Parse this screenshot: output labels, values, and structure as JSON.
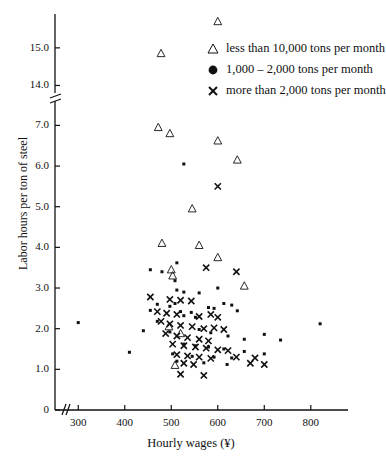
{
  "chart_data": {
    "type": "scatter",
    "title": "",
    "xlabel": "Hourly wages (¥)",
    "ylabel": "Labor hours per ton of steel",
    "xlim": [
      250,
      880
    ],
    "ylim_lower": [
      0,
      7.6
    ],
    "ylim_upper": [
      13.8,
      15.9
    ],
    "axis_break": {
      "y_below": 7.6,
      "y_above": 13.8,
      "x_break_near": 265
    },
    "grid": false,
    "legend_position": "upper-right-inside",
    "xticks": [
      300,
      400,
      500,
      600,
      700,
      800
    ],
    "yticks": [
      0,
      1.0,
      2.0,
      3.0,
      4.0,
      5.0,
      6.0,
      7.0,
      14.0,
      15.0
    ],
    "ytick_labels": [
      "0",
      "1.0",
      "2.0",
      "3.0",
      "4.0",
      "5.0",
      "6.0",
      "7.0",
      "14.0",
      "15.0"
    ],
    "xtick_labels": [
      "300",
      "400",
      "500",
      "600",
      "700",
      "800"
    ],
    "series": [
      {
        "name": "less than 10,000 tons per month",
        "marker": "triangle",
        "color": "#111111",
        "points": [
          [
            600,
            15.7
          ],
          [
            478,
            14.85
          ],
          [
            592,
            13.6
          ],
          [
            472,
            6.95
          ],
          [
            497,
            6.8
          ],
          [
            600,
            6.62
          ],
          [
            642,
            6.15
          ],
          [
            545,
            4.95
          ],
          [
            480,
            4.1
          ],
          [
            560,
            4.05
          ],
          [
            600,
            3.75
          ],
          [
            500,
            3.45
          ],
          [
            503,
            3.3
          ],
          [
            495,
            2.05
          ],
          [
            520,
            1.88
          ],
          [
            657,
            3.05
          ],
          [
            508,
            1.1
          ]
        ]
      },
      {
        "name": "1,000 – 2,000 tons per month",
        "marker": "dot",
        "color": "#111111",
        "points": [
          [
            527,
            6.05
          ],
          [
            455,
            3.45
          ],
          [
            480,
            3.4
          ],
          [
            512,
            3.62
          ],
          [
            508,
            3.18
          ],
          [
            512,
            2.95
          ],
          [
            527,
            2.9
          ],
          [
            508,
            2.62
          ],
          [
            560,
            2.88
          ],
          [
            600,
            3.0
          ],
          [
            300,
            2.15
          ],
          [
            470,
            2.6
          ],
          [
            455,
            2.45
          ],
          [
            497,
            2.55
          ],
          [
            520,
            2.42
          ],
          [
            543,
            2.4
          ],
          [
            580,
            2.52
          ],
          [
            592,
            2.5
          ],
          [
            613,
            2.62
          ],
          [
            630,
            2.58
          ],
          [
            642,
            2.44
          ],
          [
            527,
            2.32
          ],
          [
            552,
            2.28
          ],
          [
            470,
            2.18
          ],
          [
            820,
            2.12
          ],
          [
            440,
            1.95
          ],
          [
            497,
            1.92
          ],
          [
            560,
            1.98
          ],
          [
            585,
            1.9
          ],
          [
            700,
            1.86
          ],
          [
            622,
            1.82
          ],
          [
            657,
            1.74
          ],
          [
            735,
            1.72
          ],
          [
            527,
            1.62
          ],
          [
            552,
            1.58
          ],
          [
            580,
            1.55
          ],
          [
            613,
            1.5
          ],
          [
            410,
            1.42
          ],
          [
            503,
            1.38
          ],
          [
            545,
            1.32
          ],
          [
            592,
            1.3
          ],
          [
            630,
            1.28
          ],
          [
            657,
            1.44
          ],
          [
            700,
            1.38
          ],
          [
            512,
            1.2
          ],
          [
            570,
            1.16
          ],
          [
            620,
            1.12
          ]
        ]
      },
      {
        "name": "more than 2,000 tons per month",
        "marker": "cross",
        "color": "#111111",
        "points": [
          [
            600,
            5.5
          ],
          [
            575,
            3.5
          ],
          [
            640,
            3.4
          ],
          [
            455,
            2.78
          ],
          [
            497,
            2.72
          ],
          [
            520,
            2.7
          ],
          [
            543,
            2.68
          ],
          [
            470,
            2.42
          ],
          [
            490,
            2.38
          ],
          [
            512,
            2.35
          ],
          [
            560,
            2.3
          ],
          [
            585,
            2.35
          ],
          [
            600,
            2.28
          ],
          [
            478,
            2.18
          ],
          [
            497,
            2.12
          ],
          [
            520,
            2.08
          ],
          [
            545,
            2.05
          ],
          [
            570,
            2.0
          ],
          [
            592,
            2.02
          ],
          [
            613,
            1.98
          ],
          [
            488,
            1.88
          ],
          [
            512,
            1.82
          ],
          [
            535,
            1.78
          ],
          [
            560,
            1.74
          ],
          [
            580,
            1.7
          ],
          [
            503,
            1.62
          ],
          [
            527,
            1.58
          ],
          [
            552,
            1.55
          ],
          [
            575,
            1.52
          ],
          [
            600,
            1.48
          ],
          [
            622,
            1.46
          ],
          [
            512,
            1.36
          ],
          [
            535,
            1.33
          ],
          [
            560,
            1.3
          ],
          [
            585,
            1.27
          ],
          [
            640,
            1.3
          ],
          [
            680,
            1.28
          ],
          [
            527,
            1.15
          ],
          [
            548,
            1.12
          ],
          [
            670,
            1.15
          ],
          [
            700,
            1.12
          ],
          [
            520,
            0.88
          ],
          [
            570,
            0.85
          ]
        ]
      }
    ]
  },
  "axis": {
    "x_title": "Hourly wages (¥)",
    "y_title": "Labor hours per ton of steel"
  },
  "legend": {
    "items": [
      {
        "label": "less than 10,000 tons per month",
        "marker": "triangle-icon"
      },
      {
        "label": "1,000 – 2,000 tons per month",
        "marker": "filled-circle-icon"
      },
      {
        "label": "more than 2,000 tons per month",
        "marker": "cross-icon"
      }
    ]
  }
}
